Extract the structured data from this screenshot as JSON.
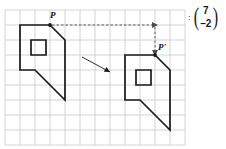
{
  "diagram": {
    "grid": {
      "x": 5,
      "y": 10,
      "cell": 15,
      "cols": 12,
      "rows": 9,
      "color": "#c9c9cf",
      "line_width": 0.8
    },
    "stroke_color": "#1a1a1a",
    "shape_stroke_width": 1.7,
    "object": {
      "name": "pre-image",
      "outline": [
        [
          20,
          25
        ],
        [
          50,
          25
        ],
        [
          65,
          40
        ],
        [
          65,
          100
        ],
        [
          35,
          70
        ],
        [
          20,
          70
        ]
      ],
      "hole": [
        [
          31,
          40
        ],
        [
          46,
          40
        ],
        [
          46,
          55
        ],
        [
          31,
          55
        ]
      ]
    },
    "image_shape": {
      "name": "image",
      "outline": [
        [
          125,
          55
        ],
        [
          155,
          55
        ],
        [
          170,
          70
        ],
        [
          170,
          130
        ],
        [
          140,
          100
        ],
        [
          125,
          100
        ]
      ],
      "hole": [
        [
          136,
          70
        ],
        [
          151,
          70
        ],
        [
          151,
          85
        ],
        [
          136,
          85
        ]
      ]
    },
    "point_p": {
      "label": "P",
      "x": 50,
      "y": 25
    },
    "point_p_prime": {
      "label": "P'",
      "x": 155,
      "y": 55
    },
    "dashed_path": {
      "horizontal": {
        "x1": 52,
        "y1": 25,
        "x2": 155,
        "y2": 25
      },
      "vertical": {
        "x1": 155,
        "y1": 27,
        "x2": 155,
        "y2": 53
      },
      "dash_pattern": "2.5,2",
      "color": "#4a4a55"
    },
    "motion_arrow": {
      "x1": 82,
      "y1": 57,
      "x2": 110,
      "y2": 72,
      "color": "#1a1a1a"
    },
    "vector": {
      "separator": ":",
      "left_paren": "(",
      "right_paren": ")",
      "x_component": "7",
      "y_component": "–2"
    }
  }
}
